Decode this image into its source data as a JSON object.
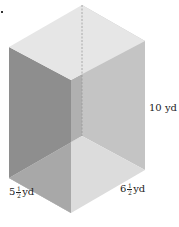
{
  "figure": {
    "type": "rectangular-prism",
    "colors": {
      "top_face": "#e6e6e6",
      "left_face": "#8e8e8e",
      "right_back_face": "#c4c4c4",
      "bottom_face": "#dcdcdc",
      "left_bottom_face": "#a8a8a8",
      "dashed_edge": "#9a9a9a"
    }
  },
  "labels": {
    "height": "10 yd",
    "width_whole": "5",
    "width_num": "1",
    "width_den": "2",
    "width_unit": "yd",
    "depth_whole": "6",
    "depth_num": "1",
    "depth_den": "2",
    "depth_unit": "yd"
  }
}
